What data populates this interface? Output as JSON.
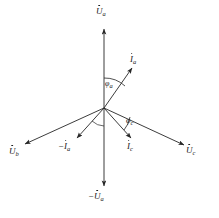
{
  "figure": {
    "origin": {
      "x": 104,
      "y": 108
    },
    "stroke_color": "#262626",
    "background_color": "#ffffff"
  },
  "vectors": [
    {
      "id": "Ua",
      "symbol": "U",
      "subscript": "a",
      "prefix": "",
      "dot": true,
      "label_text": "U̇a",
      "tip": {
        "x": 104,
        "y": 27
      },
      "label_pos": {
        "x": 97,
        "y": 8
      }
    },
    {
      "id": "Ub",
      "symbol": "U",
      "subscript": "b",
      "prefix": "",
      "dot": true,
      "label_text": "U̇b",
      "tip": {
        "x": 22,
        "y": 146
      },
      "label_pos": {
        "x": 11,
        "y": 148
      }
    },
    {
      "id": "Uc",
      "symbol": "U",
      "subscript": "c",
      "prefix": "",
      "dot": true,
      "label_text": "U̇c",
      "tip": {
        "x": 187,
        "y": 147
      },
      "label_pos": {
        "x": 188,
        "y": 148
      }
    },
    {
      "id": "Ia",
      "symbol": "I",
      "subscript": "a",
      "prefix": "",
      "dot": true,
      "label_text": "İa",
      "tip": {
        "x": 134,
        "y": 66
      },
      "label_pos": {
        "x": 130,
        "y": 57
      }
    },
    {
      "id": "-Ia",
      "symbol": "I",
      "subscript": "a",
      "prefix": "−",
      "dot": true,
      "label_text": "−İa",
      "tip": {
        "x": 75,
        "y": 140
      },
      "label_pos": {
        "x": 62,
        "y": 142
      }
    },
    {
      "id": "Ic",
      "symbol": "I",
      "subscript": "c",
      "prefix": "",
      "dot": true,
      "label_text": "İc",
      "tip": {
        "x": 133,
        "y": 140
      },
      "label_pos": {
        "x": 128,
        "y": 142
      }
    },
    {
      "id": "-Ua",
      "symbol": "U",
      "subscript": "a",
      "prefix": "−",
      "dot": true,
      "label_text": "−U̇a",
      "tip": {
        "x": 104,
        "y": 188
      },
      "label_pos": {
        "x": 90,
        "y": 192
      }
    }
  ],
  "angles": [
    {
      "id": "phi-a",
      "symbol": "φ",
      "subscript": "a",
      "label_text": "φa",
      "between": [
        "Ua",
        "Ia"
      ],
      "label_pos": {
        "x": 103,
        "y": 80
      }
    },
    {
      "id": "phi-c",
      "symbol": "φ",
      "subscript": "c",
      "label_text": "φc",
      "between": [
        "Ic",
        "Uc"
      ],
      "label_pos": {
        "x": 126,
        "y": 117
      }
    }
  ]
}
